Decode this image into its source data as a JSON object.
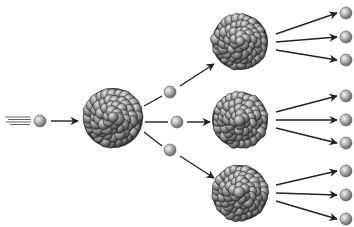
{
  "diagram": {
    "type": "nuclear-chain-reaction",
    "colors": {
      "neutron_light": "#e6e6e6",
      "neutron_mid": "#a8a8a8",
      "neutron_dark": "#6a6a6a",
      "nucleus_light": "#c8c8c8",
      "nucleus_mid": "#8a8a8a",
      "nucleus_dark": "#2a2a2a",
      "arrow": "#222222"
    },
    "incoming_neutron": {
      "x": 40,
      "y": 121,
      "r": 6
    },
    "central_nucleus": {
      "x": 113,
      "y": 118,
      "r": 30
    },
    "first_gen_neutrons": [
      {
        "x": 170,
        "y": 92,
        "r": 6
      },
      {
        "x": 177,
        "y": 122,
        "r": 6
      },
      {
        "x": 170,
        "y": 150,
        "r": 6
      }
    ],
    "second_gen_nuclei": [
      {
        "x": 240,
        "y": 42,
        "r": 28
      },
      {
        "x": 240,
        "y": 120,
        "r": 28
      },
      {
        "x": 240,
        "y": 193,
        "r": 28
      }
    ],
    "second_gen_neutrons": [
      {
        "x": 346,
        "y": 13,
        "r": 6
      },
      {
        "x": 346,
        "y": 37,
        "r": 6
      },
      {
        "x": 346,
        "y": 60,
        "r": 6
      },
      {
        "x": 346,
        "y": 96,
        "r": 6
      },
      {
        "x": 346,
        "y": 120,
        "r": 6
      },
      {
        "x": 346,
        "y": 143,
        "r": 6
      },
      {
        "x": 346,
        "y": 171,
        "r": 6
      },
      {
        "x": 346,
        "y": 195,
        "r": 6
      },
      {
        "x": 346,
        "y": 219,
        "r": 6
      }
    ]
  }
}
